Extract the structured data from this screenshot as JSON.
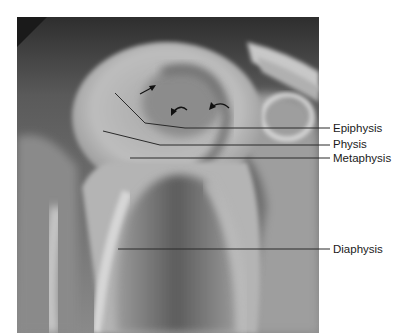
{
  "figure": {
    "type": "annotated radiograph",
    "labels": [
      {
        "id": "epiphysis",
        "text": "Epiphysis",
        "x": 333,
        "y": 124
      },
      {
        "id": "physis",
        "text": "Physis",
        "x": 333,
        "y": 140
      },
      {
        "id": "metaphysis",
        "text": "Metaphysis",
        "x": 333,
        "y": 153
      },
      {
        "id": "diaphysis",
        "text": "Diaphysis",
        "x": 333,
        "y": 245
      }
    ],
    "arrows": [
      {
        "type": "straight",
        "count": 1
      },
      {
        "type": "curved",
        "count": 2
      }
    ],
    "colors": {
      "background": "#ffffff",
      "line": "#2a2a2a",
      "text": "#1a1a1a"
    }
  }
}
